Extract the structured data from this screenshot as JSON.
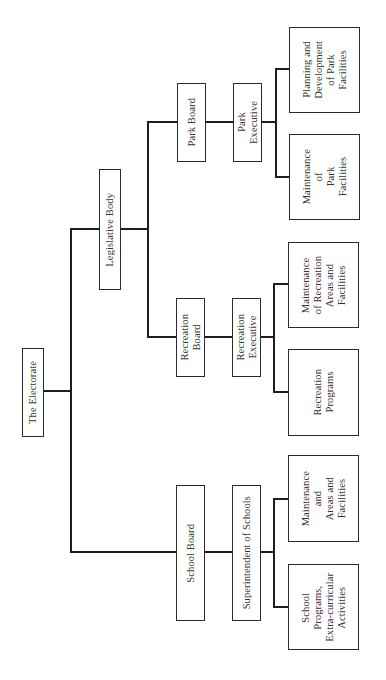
{
  "diagram": {
    "orientation": "rotated 90° counter-clockwise",
    "nodes": {
      "electorate": "The Electorate",
      "legislative_body": "Legislative Body",
      "school_board": "School Board",
      "superintendent": "Superintendent of Schools",
      "school_maintenance": "Maintenance\nand\nAreas and\nFacilities",
      "school_programs": "School\nPrograms,\nExtra-curricular\nActivities",
      "recreation_board": "Recreation\nBoard",
      "recreation_executive": "Recreation\nExecutive",
      "recreation_maintenance": "Maintenance\nof Recreation\nAreas and\nFacilities",
      "recreation_programs": "Recreation\nPrograms",
      "park_board": "Park Board",
      "park_executive": "Park\nExecutive",
      "park_maintenance": "Maintenance\nof\nPark\nFacilities",
      "park_planning": "Planning and\nDevelopment\nof Park\nFacilities"
    },
    "edges": [
      [
        "The Electorate",
        "Legislative Body"
      ],
      [
        "The Electorate",
        "School Board"
      ],
      [
        "Legislative Body",
        "Park Board"
      ],
      [
        "Legislative Body",
        "Recreation Board"
      ],
      [
        "School Board",
        "Superintendent of Schools"
      ],
      [
        "Superintendent of Schools",
        "Maintenance and Areas and Facilities"
      ],
      [
        "Superintendent of Schools",
        "School Programs, Extra-curricular Activities"
      ],
      [
        "Recreation Board",
        "Recreation Executive"
      ],
      [
        "Recreation Executive",
        "Maintenance of Recreation Areas and Facilities"
      ],
      [
        "Recreation Executive",
        "Recreation Programs"
      ],
      [
        "Park Board",
        "Park Executive"
      ],
      [
        "Park Executive",
        "Maintenance of Park Facilities"
      ],
      [
        "Park Executive",
        "Planning and Development of Park Facilities"
      ]
    ]
  }
}
